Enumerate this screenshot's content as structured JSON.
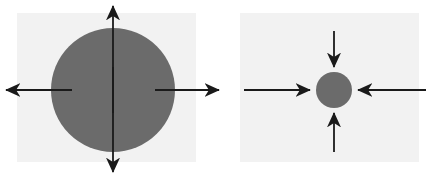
{
  "figure": {
    "width": 431,
    "height": 177,
    "background": "#ffffff",
    "panel_fill": "#f2f2f2",
    "sphere_fill": "#6b6b6b",
    "arrow_color": "#1a1a1a",
    "title": "",
    "caption": ""
  },
  "diagrams": [
    {
      "id": "expansion",
      "name": "large-sphere-outward-arrows",
      "label": "",
      "panel": {
        "x": 17,
        "y": 13,
        "width": 179,
        "height": 149
      },
      "sphere": {
        "cx": 113,
        "cy": 90,
        "r": 62
      },
      "arrow_direction": "outward",
      "arrow_count": 4,
      "arrows": [
        {
          "name": "arrow-up",
          "x1": 113,
          "y1": 113,
          "x2": 113,
          "y2": 3
        },
        {
          "name": "arrow-down",
          "x1": 113,
          "y1": 67,
          "x2": 113,
          "y2": 175
        },
        {
          "name": "arrow-left",
          "x1": 72,
          "y1": 90,
          "x2": 3,
          "y2": 90
        },
        {
          "name": "arrow-right",
          "x1": 155,
          "y1": 90,
          "x2": 222,
          "y2": 90
        }
      ]
    },
    {
      "id": "compression",
      "name": "small-sphere-inward-arrows",
      "label": "",
      "panel": {
        "x": 240,
        "y": 13,
        "width": 179,
        "height": 149
      },
      "sphere": {
        "cx": 334,
        "cy": 90,
        "r": 18
      },
      "arrow_direction": "inward",
      "arrow_count": 4,
      "arrows": [
        {
          "name": "arrow-down",
          "x1": 334,
          "y1": 31,
          "x2": 334,
          "y2": 70
        },
        {
          "name": "arrow-up",
          "x1": 334,
          "y1": 152,
          "x2": 334,
          "y2": 110
        },
        {
          "name": "arrow-right",
          "x1": 244,
          "y1": 90,
          "x2": 313,
          "y2": 90
        },
        {
          "name": "arrow-left",
          "x1": 426,
          "y1": 90,
          "x2": 355,
          "y2": 90
        }
      ]
    }
  ],
  "annotations": {
    "watermarks": [
      {
        "name": "watermark-left-panel",
        "text": "",
        "x": 55,
        "y": 140
      },
      {
        "name": "watermark-right-panel",
        "text": "",
        "x": 392,
        "y": 143
      }
    ]
  }
}
